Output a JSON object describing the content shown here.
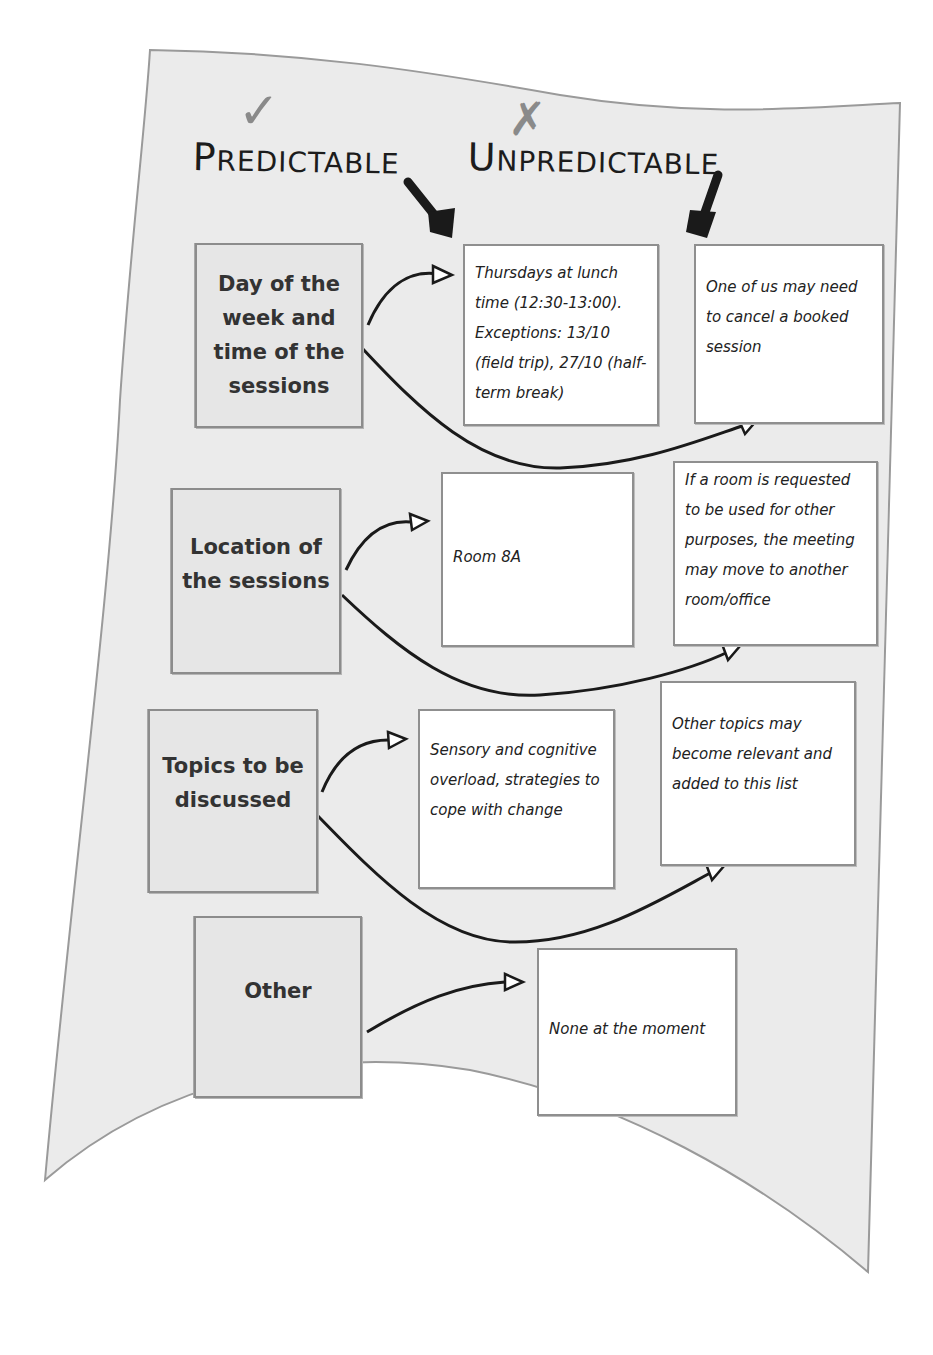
{
  "headings": {
    "predictable": {
      "first": "P",
      "rest": "REDICTABLE",
      "mark": "✓",
      "mark_icon": "check-icon"
    },
    "unpredictable": {
      "first": "U",
      "rest": "NPREDICTABLE",
      "mark": "✗",
      "mark_icon": "cross-icon"
    }
  },
  "rows": [
    {
      "category": "Day of the week and time of the sessions",
      "predictable": "Thursdays at lunch time (12:30-13:00). Exceptions: 13/10 (field trip), 27/10 (half-term break)",
      "unpredictable": "One of us may need to cancel a booked session"
    },
    {
      "category": "Location of the sessions",
      "predictable": "Room 8A",
      "unpredictable": "If a room is requested to be used for other purposes, the meeting may move to another room/office"
    },
    {
      "category": "Topics to be discussed",
      "predictable": "Sensory and cognitive overload, strategies to cope with change",
      "unpredictable": "Other topics may become relevant and added to this list"
    },
    {
      "category": "Other",
      "predictable": "None at the moment"
    }
  ],
  "colors": {
    "paper": "#ebebeb",
    "paper_edge": "#9a9a9a",
    "category_box": "#e6e6e6",
    "note_box": "#ffffff",
    "ink": "#1c1c1c",
    "mark": "#8a8a8a"
  }
}
